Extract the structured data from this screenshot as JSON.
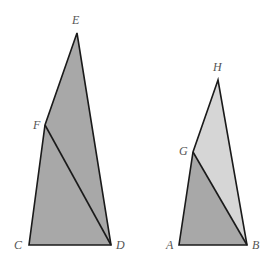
{
  "colors": {
    "background": "#ffffff",
    "dark_fill": "#a8a8a8",
    "light_fill": "#d6d6d6",
    "stroke": "#1a1a1a",
    "label": "#555555"
  },
  "figures": [
    {
      "name": "left-figure",
      "vertices": {
        "E": {
          "x": 77,
          "y": 33
        },
        "F": {
          "x": 45,
          "y": 125
        },
        "C": {
          "x": 29,
          "y": 245
        },
        "D": {
          "x": 111,
          "y": 245
        }
      },
      "labels": [
        {
          "text": "E",
          "x": 72,
          "y": 24
        },
        {
          "text": "F",
          "x": 33,
          "y": 129
        },
        {
          "text": "C",
          "x": 14,
          "y": 249
        },
        {
          "text": "D",
          "x": 116,
          "y": 249
        }
      ],
      "regions": [
        {
          "name": "triangle-EFD",
          "points": "77,33 45,125 111,245",
          "fill": "dark"
        },
        {
          "name": "triangle-FCD",
          "points": "45,125 29,245 111,245",
          "fill": "dark"
        }
      ],
      "diagonal": {
        "from": "F",
        "to": "D"
      }
    },
    {
      "name": "right-figure",
      "vertices": {
        "H": {
          "x": 218,
          "y": 80
        },
        "G": {
          "x": 193,
          "y": 152
        },
        "A": {
          "x": 179,
          "y": 245
        },
        "B": {
          "x": 247,
          "y": 245
        }
      },
      "labels": [
        {
          "text": "H",
          "x": 213,
          "y": 71
        },
        {
          "text": "G",
          "x": 179,
          "y": 155
        },
        {
          "text": "A",
          "x": 166,
          "y": 249
        },
        {
          "text": "B",
          "x": 252,
          "y": 249
        }
      ],
      "regions": [
        {
          "name": "triangle-HGB",
          "points": "218,80 193,152 247,245",
          "fill": "light"
        },
        {
          "name": "triangle-GAB",
          "points": "193,152 179,245 247,245",
          "fill": "dark"
        }
      ],
      "diagonal": {
        "from": "G",
        "to": "B"
      }
    }
  ]
}
